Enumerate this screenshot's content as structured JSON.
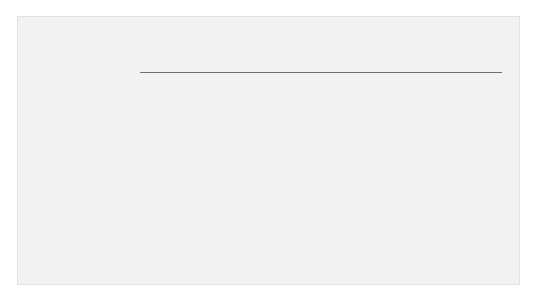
{
  "chart_data": {
    "type": "bar",
    "orientation": "horizontal",
    "xlabel": "",
    "ylabel": "Social Media",
    "xlim": [
      0,
      3
    ],
    "grid": false,
    "legend": "none",
    "axis_ticks": [
      "0%",
      "1%",
      "2%",
      "3%"
    ],
    "axis_tick_values": [
      0,
      1,
      2,
      3
    ],
    "series_names": [
      "Overall",
      "Fashion",
      "FYRST"
    ],
    "categories": [
      "Twitter",
      "Facebook",
      "Instagram"
    ],
    "series": [
      {
        "name": "Overall",
        "values": [
          0.19,
          1.0,
          3.0
        ]
      },
      {
        "name": "Fashion",
        "values": [
          0.26,
          0.25,
          1.55
        ]
      },
      {
        "name": "FYRST",
        "values": [
          0.19,
          0.25,
          1.29
        ]
      }
    ],
    "colors": {
      "overall": "#8f8f8f",
      "fashion": "#3a3a3a",
      "fyrst": "#9a9a9a",
      "axis": "#6f6f6f",
      "panel": "#f2f2f2"
    }
  },
  "axis": {
    "header": "Social Media",
    "ticks": [
      {
        "label": "0%",
        "value": 0
      },
      {
        "label": "1%",
        "value": 1
      },
      {
        "label": "2%",
        "value": 2
      },
      {
        "label": "3%",
        "value": 3
      }
    ]
  },
  "groups": [
    {
      "label": "Twitter",
      "rows": [
        {
          "series": "Overall",
          "value": 0.19
        },
        {
          "series": "Fashion",
          "value": 0.26
        },
        {
          "series": "FYRST",
          "value": 0.19
        }
      ]
    },
    {
      "label": "Facebook",
      "rows": [
        {
          "series": "Overall",
          "value": 1.0
        },
        {
          "series": "Fashion",
          "value": 0.25
        },
        {
          "series": "FYRST",
          "value": 0.25
        }
      ]
    },
    {
      "label": "Instagram",
      "rows": [
        {
          "series": "Overall",
          "value": 3.0
        },
        {
          "series": "Fashion",
          "value": 1.55
        },
        {
          "series": "FYRST",
          "value": 1.29
        }
      ]
    }
  ]
}
